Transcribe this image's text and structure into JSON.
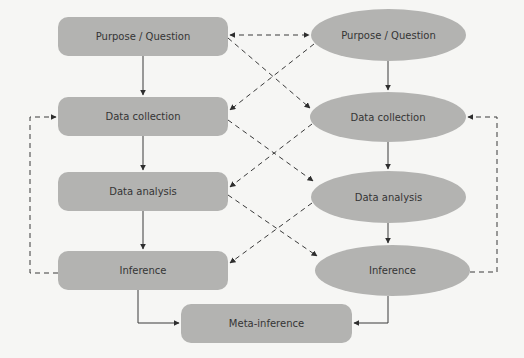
{
  "diagram": {
    "left_column": [
      {
        "id": "L1",
        "label": "Purpose / Question",
        "shape": "rounded-rect"
      },
      {
        "id": "L2",
        "label": "Data collection",
        "shape": "rounded-rect"
      },
      {
        "id": "L3",
        "label": "Data analysis",
        "shape": "rounded-rect"
      },
      {
        "id": "L4",
        "label": "Inference",
        "shape": "rounded-rect"
      }
    ],
    "right_column": [
      {
        "id": "R1",
        "label": "Purpose / Question",
        "shape": "ellipse"
      },
      {
        "id": "R2",
        "label": "Data collection",
        "shape": "ellipse"
      },
      {
        "id": "R3",
        "label": "Data analysis",
        "shape": "ellipse"
      },
      {
        "id": "R4",
        "label": "Inference",
        "shape": "ellipse"
      }
    ],
    "bottom": {
      "id": "M",
      "label": "Meta-inference",
      "shape": "rounded-rect"
    },
    "edges": [
      {
        "from": "L1",
        "to": "L2",
        "style": "solid"
      },
      {
        "from": "L2",
        "to": "L3",
        "style": "solid"
      },
      {
        "from": "L3",
        "to": "L4",
        "style": "solid"
      },
      {
        "from": "R1",
        "to": "R2",
        "style": "solid"
      },
      {
        "from": "R2",
        "to": "R3",
        "style": "solid"
      },
      {
        "from": "R3",
        "to": "R4",
        "style": "solid"
      },
      {
        "from": "L4",
        "to": "M",
        "style": "solid"
      },
      {
        "from": "R4",
        "to": "M",
        "style": "solid"
      },
      {
        "from": "L1",
        "to": "R1",
        "style": "dashed",
        "bidirectional": true
      },
      {
        "from": "L1",
        "to": "R2",
        "style": "dashed"
      },
      {
        "from": "R1",
        "to": "L2",
        "style": "dashed"
      },
      {
        "from": "L2",
        "to": "R3",
        "style": "dashed"
      },
      {
        "from": "R2",
        "to": "L3",
        "style": "dashed"
      },
      {
        "from": "L3",
        "to": "R4",
        "style": "dashed"
      },
      {
        "from": "R3",
        "to": "L4",
        "style": "dashed"
      },
      {
        "from": "L4",
        "to": "L2",
        "style": "dashed",
        "note": "feedback loop left"
      },
      {
        "from": "R4",
        "to": "R2",
        "style": "dashed",
        "note": "feedback loop right"
      }
    ],
    "colors": {
      "node_fill": "#b3b3b1",
      "text": "#353535",
      "line": "#3a3a3a",
      "background": "#f6f6f4"
    }
  }
}
